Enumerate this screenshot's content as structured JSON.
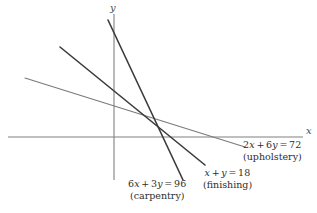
{
  "figure": {
    "type": "linear-programming-constraint-graph",
    "width": 317,
    "height": 213,
    "background_color": "#ffffff"
  },
  "axes": {
    "x_label": "x",
    "y_label": "y",
    "axis_color": "#808080",
    "origin_px": [
      114,
      137
    ],
    "x_axis_px": {
      "x1": 8,
      "y1": 137,
      "x2": 303,
      "y2": 137
    },
    "y_axis_px": {
      "x1": 114,
      "y1": 14,
      "x2": 114,
      "y2": 180
    }
  },
  "chart_data": {
    "type": "line",
    "title": "",
    "xlabel": "x",
    "ylabel": "y",
    "grid": false,
    "legend": "inline-annotations",
    "series": [
      {
        "name": "carpentry",
        "equation": "6x + 3y = 96",
        "coefficients": {
          "x": 6,
          "y": 3,
          "rhs": 96
        },
        "slope": -2,
        "x_intercept": 16,
        "y_intercept": 32,
        "color": "#3a3a3a",
        "width": 1.6,
        "px": {
          "x1": 108,
          "y1": 20,
          "x2": 183,
          "y2": 180
        }
      },
      {
        "name": "finishing",
        "equation": "x + y = 18",
        "coefficients": {
          "x": 1,
          "y": 1,
          "rhs": 18
        },
        "slope": -1,
        "x_intercept": 18,
        "y_intercept": 18,
        "color": "#3a3a3a",
        "width": 1.6,
        "px": {
          "x1": 60,
          "y1": 47,
          "x2": 205,
          "y2": 165
        }
      },
      {
        "name": "upholstery",
        "equation": "2x + 6y = 72",
        "coefficients": {
          "x": 2,
          "y": 6,
          "rhs": 72
        },
        "slope": -0.3333,
        "x_intercept": 36,
        "y_intercept": 12,
        "color": "#7a7a7a",
        "width": 1.1,
        "px": {
          "x1": 25,
          "y1": 78,
          "x2": 245,
          "y2": 147
        }
      }
    ]
  },
  "annotations": {
    "carpentry": {
      "lhs_coeff_x": "6",
      "var_x": "x",
      "op1": "+",
      "lhs_coeff_y": "3",
      "var_y": "y",
      "eq": "=",
      "rhs": "96",
      "name": "(carpentry)",
      "pos_px": [
        128,
        180
      ]
    },
    "finishing": {
      "var_x": "x",
      "op1": "+",
      "var_y": "y",
      "eq": "=",
      "rhs": "18",
      "name": "(finishing)",
      "pos_px": [
        203,
        169
      ]
    },
    "upholstery": {
      "lhs_coeff_x": "2",
      "var_x": "x",
      "op1": "+",
      "lhs_coeff_y": "6",
      "var_y": "y",
      "eq": "=",
      "rhs": "72",
      "name": "(upholstery)",
      "pos_px": [
        243,
        141
      ]
    }
  }
}
